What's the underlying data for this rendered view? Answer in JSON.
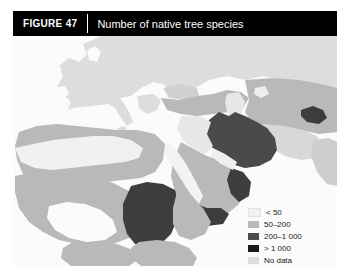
{
  "figure": {
    "number_label": "FIGURE 47",
    "title": "Number of native tree species"
  },
  "legend": {
    "items": [
      {
        "label": "< 50",
        "color": "#f2f1ef"
      },
      {
        "label": "50–200",
        "color": "#b9b9b7"
      },
      {
        "label": "200–1 000",
        "color": "#4d4d4d"
      },
      {
        "label": "> 1 000",
        "color": "#1a1a1a"
      },
      {
        "label": "No data",
        "color": "#dedddb"
      }
    ]
  },
  "map": {
    "ocean_color": "#fbfbfb",
    "regions": [
      {
        "name": "europe",
        "class": "no-data",
        "color": "#dedddb"
      },
      {
        "name": "north-africa",
        "class": "50-200",
        "color": "#b9b9b7"
      },
      {
        "name": "sahel",
        "class": "< 50",
        "color": "#f2f1ef"
      },
      {
        "name": "sudan",
        "class": "200-1 000",
        "color": "#4d4d4d"
      },
      {
        "name": "iran",
        "class": "200-1 000",
        "color": "#4d4d4d"
      },
      {
        "name": "yemen",
        "class": "200-1 000",
        "color": "#4d4d4d"
      },
      {
        "name": "oman",
        "class": "200-1 000",
        "color": "#4d4d4d"
      },
      {
        "name": "turkey-caucasus",
        "class": "50-200",
        "color": "#b9b9b7"
      },
      {
        "name": "arabian-peninsula",
        "class": "50-200",
        "color": "#b9b9b7"
      },
      {
        "name": "central-asia",
        "class": "50-200",
        "color": "#b9b9b7"
      }
    ]
  }
}
